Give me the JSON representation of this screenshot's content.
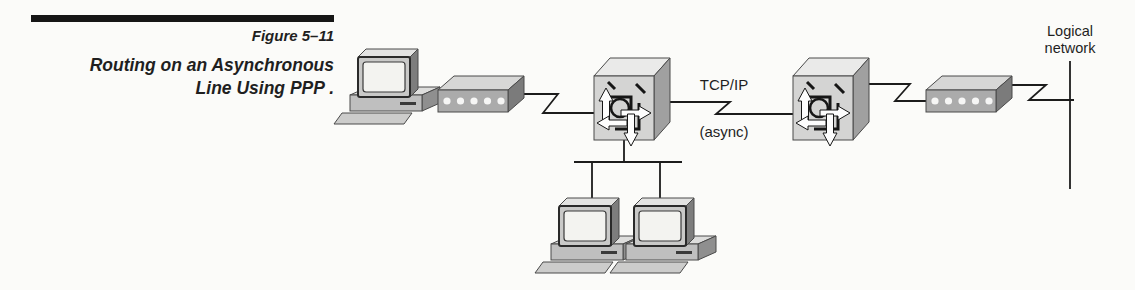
{
  "figure": {
    "label": "Figure 5–11",
    "caption": [
      "Routing on an Asynchronous",
      "Line Using PPP ."
    ]
  },
  "diagram": {
    "link_label_top": "TCP/IP",
    "link_label_bottom": "(async)",
    "network_label": [
      "Logical",
      "network"
    ],
    "nodes": [
      {
        "name": "workstation-left",
        "type": "workstation-icon"
      },
      {
        "name": "modem-left",
        "type": "modem-icon"
      },
      {
        "name": "router-left",
        "type": "router-icon"
      },
      {
        "name": "router-right",
        "type": "router-icon"
      },
      {
        "name": "modem-right",
        "type": "modem-icon"
      },
      {
        "name": "workstation-lan-1",
        "type": "workstation-icon"
      },
      {
        "name": "workstation-lan-2",
        "type": "workstation-icon"
      }
    ],
    "links": [
      "workstation-left to modem-left",
      "modem-left to router-left (async zigzag)",
      "router-left to router-right (TCP/IP async)",
      "router-right to modem-right (async zigzag)",
      "modem-right to logical-network (async zigzag)",
      "router-left to lan-bus with workstation-lan-1 and workstation-lan-2"
    ],
    "colors": {
      "line": "#1c1c1c",
      "face_front": "#d4d4d3",
      "face_top": "#eaeae9",
      "face_side": "#a0a0a0",
      "modem_front": "#ababab",
      "screen": "#f3f3f0",
      "paper": "#fbfbf9"
    }
  }
}
